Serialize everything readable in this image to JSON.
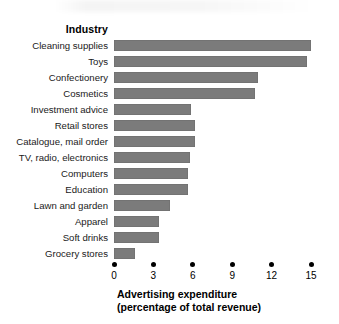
{
  "chart_data": {
    "type": "bar",
    "orientation": "horizontal",
    "title": "",
    "category_header": "Industry",
    "xlabel": "Advertising expenditure",
    "xlabel_line2": "(percentage of total revenue)",
    "ylabel": "",
    "xlim": [
      0,
      15
    ],
    "xticks": [
      0,
      3,
      6,
      9,
      12,
      15
    ],
    "xtick_labels": [
      "0",
      "3",
      "6",
      "9",
      "12",
      "15"
    ],
    "grid": false,
    "legend": null,
    "bar_color": "#7b7b7b",
    "categories": [
      "Cleaning supplies",
      "Toys",
      "Confectionery",
      "Cosmetics",
      "Investment advice",
      "Retail stores",
      "Catalogue, mail order",
      "TV, radio, electronics",
      "Computers",
      "Education",
      "Lawn and garden",
      "Apparel",
      "Soft drinks",
      "Grocery stores"
    ],
    "values": [
      15.0,
      14.7,
      11.0,
      10.7,
      5.9,
      6.2,
      6.2,
      5.8,
      5.6,
      5.6,
      4.3,
      3.4,
      3.4,
      1.6
    ]
  }
}
